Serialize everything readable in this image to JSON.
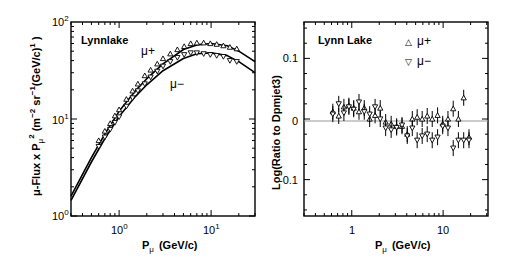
{
  "chart_data": [
    {
      "type": "scatter",
      "panel": "left",
      "title": "Lynnlake",
      "xlabel": "P_μ (GeV/c)",
      "ylabel": "μ-Flux x P_μ^2 (m^-2 sr^-1 (GeV/c)^1)",
      "xscale": "log",
      "yscale": "log",
      "xlim": [
        0.3,
        30
      ],
      "ylim": [
        1,
        100
      ],
      "xticks": [
        "10^0",
        "10^1"
      ],
      "yticks": [
        "10^0",
        "10^1",
        "10^2"
      ],
      "annotations": [
        "μ+",
        "μ−"
      ],
      "series": [
        {
          "name": "μ+",
          "marker": "triangle-up",
          "x": [
            0.6,
            0.7,
            0.8,
            0.9,
            1.0,
            1.2,
            1.4,
            1.6,
            1.9,
            2.2,
            2.6,
            3.0,
            3.6,
            4.3,
            5.1,
            6.0,
            7.0,
            8.3,
            9.8,
            11.5,
            13.6,
            16,
            19
          ],
          "y": [
            6.0,
            7.5,
            9.0,
            10.8,
            12.5,
            16,
            19.5,
            23,
            28,
            32,
            37,
            42,
            47,
            52,
            56,
            60,
            61,
            61,
            60,
            59,
            57,
            55,
            53
          ]
        },
        {
          "name": "μ−",
          "marker": "triangle-down",
          "x": [
            0.6,
            0.7,
            0.8,
            0.9,
            1.0,
            1.2,
            1.4,
            1.6,
            1.9,
            2.2,
            2.6,
            3.0,
            3.6,
            4.3,
            5.1,
            6.0,
            7.0,
            8.3,
            9.8,
            11.5,
            13.6,
            16,
            19
          ],
          "y": [
            5.2,
            6.5,
            7.8,
            9.2,
            10.5,
            13.5,
            16.5,
            19.5,
            23,
            27,
            31,
            35,
            39,
            43,
            46,
            48,
            48,
            47,
            46,
            45,
            44,
            40,
            39
          ]
        },
        {
          "name": "μ+ model",
          "type": "line",
          "x": [
            0.3,
            0.5,
            0.7,
            1.0,
            1.5,
            2,
            3,
            5,
            7,
            10,
            15,
            20,
            30
          ],
          "y": [
            1.6,
            4.0,
            7.0,
            12.0,
            19.5,
            26,
            37,
            52,
            58,
            60,
            57,
            50,
            39
          ]
        },
        {
          "name": "μ− model",
          "type": "line",
          "x": [
            0.3,
            0.5,
            0.7,
            1.0,
            1.5,
            2,
            3,
            5,
            7,
            10,
            15,
            20,
            30
          ],
          "y": [
            1.45,
            3.6,
            6.3,
            10.6,
            17,
            22.5,
            31.5,
            42,
            47,
            48,
            45,
            39,
            30
          ]
        }
      ]
    },
    {
      "type": "scatter",
      "panel": "right",
      "title": "Lynn Lake",
      "xlabel": "P_μ (GeV/c)",
      "ylabel": "Log(Ratio to Dpmjet3)",
      "xscale": "log",
      "xlim": [
        0.3,
        31
      ],
      "ylim": [
        -0.16,
        0.16
      ],
      "xticks": [
        "1",
        "10"
      ],
      "yticks": [
        "0.1",
        "0",
        "-0.1"
      ],
      "legend": [
        "μ+",
        "μ−"
      ],
      "legend_position": "upper right",
      "reference_line": 0,
      "series": [
        {
          "name": "μ+",
          "marker": "triangle-up",
          "x": [
            0.62,
            0.72,
            0.82,
            0.93,
            1.05,
            1.2,
            1.37,
            1.57,
            1.8,
            2.05,
            2.35,
            2.7,
            3.1,
            3.55,
            4.05,
            4.6,
            5.2,
            5.9,
            6.7,
            7.6,
            8.7,
            9.9,
            11.3,
            12.9,
            14.7,
            16.8,
            19.2
          ],
          "y": [
            0.012,
            0.005,
            0.02,
            0.022,
            0.018,
            0.012,
            0.018,
            0.0,
            0.006,
            0.018,
            -0.005,
            -0.008,
            -0.012,
            -0.012,
            -0.025,
            0.0,
            0.003,
            0.0,
            0.005,
            0.0,
            0.006,
            -0.008,
            0.0,
            0.017,
            0.0,
            0.035,
            -0.03
          ]
        },
        {
          "name": "μ−",
          "marker": "triangle-down",
          "x": [
            0.62,
            0.72,
            0.82,
            0.93,
            1.05,
            1.2,
            1.37,
            1.57,
            1.8,
            2.05,
            2.35,
            2.7,
            3.1,
            3.55,
            4.05,
            4.6,
            5.2,
            5.9,
            6.7,
            7.6,
            8.7,
            9.9,
            11.3,
            12.9,
            14.7,
            16.8,
            19.2
          ],
          "y": [
            0.008,
            0.025,
            0.01,
            0.02,
            0.016,
            0.028,
            0.012,
            0.008,
            0.02,
            0.0,
            -0.015,
            -0.018,
            -0.014,
            -0.01,
            -0.028,
            -0.015,
            -0.035,
            -0.028,
            -0.025,
            -0.035,
            -0.03,
            -0.012,
            -0.015,
            -0.048,
            -0.035,
            -0.035,
            -0.035
          ]
        }
      ]
    }
  ],
  "left_panel": {
    "title": "Lynnlake",
    "label_mu_plus": "μ+",
    "label_mu_minus": "μ−",
    "ylabel": "μ-Flux x P",
    "xlabel_main": "P",
    "xlabel_sub": "μ",
    "xlabel_unit": "(GeV/c)",
    "ytick_base": "10",
    "ytick_exp": [
      "2",
      "1",
      "0"
    ],
    "xtick_exp": [
      "0",
      "1"
    ]
  },
  "right_panel": {
    "title": "Lynn Lake",
    "legend_plus": "μ+",
    "legend_minus": "μ−",
    "legend_plus_symbol": "△",
    "legend_minus_symbol": "▽",
    "ylabel": "Log(Ratio to Dpmjet3)",
    "yticks": [
      "0.1",
      "0",
      "-0.1"
    ],
    "xticks": [
      "1",
      "10"
    ],
    "xlabel_main": "P",
    "xlabel_sub": "μ",
    "xlabel_unit": "(GeV/c)"
  }
}
